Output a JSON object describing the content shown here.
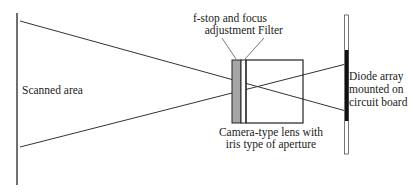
{
  "diagram": {
    "labels": {
      "scanned_area": "Scanned area",
      "fstop_line1": "f-stop and focus",
      "fstop_line2": "adjustment",
      "filter": "Filter",
      "lens_line1": "Camera-type lens with",
      "lens_line2": "iris type of aperture",
      "diode_line1": "Diode array",
      "diode_line2": "mounted on",
      "diode_line3": "circuit board"
    },
    "colors": {
      "line": "#222222",
      "fstop_fill": "#a6a6a6",
      "diode_fill": "#111111",
      "board_outline": "#555555"
    }
  }
}
